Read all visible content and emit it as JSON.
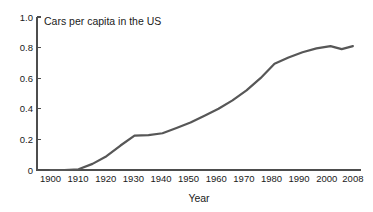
{
  "chart_data": {
    "type": "line",
    "title": "Cars per capita in the US",
    "xlabel": "Year",
    "ylabel": "",
    "xlim": [
      1895,
      2012
    ],
    "ylim": [
      0,
      1.0
    ],
    "grid": false,
    "legend": "none",
    "x_tick_labels": [
      "1900",
      "1910",
      "1920",
      "1930",
      "1940",
      "1950",
      "1960",
      "1970",
      "1980",
      "1990",
      "2000",
      "2008"
    ],
    "x_tick_values": [
      1900,
      1910,
      1920,
      1930,
      1940,
      1950,
      1960,
      1970,
      1980,
      1990,
      2000,
      2008
    ],
    "y_tick_labels": [
      "0",
      "0.2",
      "0.4",
      "0.6",
      "0.8",
      "1.0"
    ],
    "y_tick_values": [
      0,
      0.2,
      0.4,
      0.6,
      0.8,
      1.0
    ],
    "series": [
      {
        "name": "Cars per capita in the US",
        "color": "#575757",
        "x": [
          1900,
          1905,
          1910,
          1915,
          1920,
          1925,
          1930,
          1935,
          1940,
          1945,
          1950,
          1955,
          1960,
          1965,
          1970,
          1975,
          1980,
          1985,
          1990,
          1995,
          2000,
          2004,
          2008
        ],
        "values": [
          0.0,
          0.0,
          0.005,
          0.04,
          0.09,
          0.16,
          0.225,
          0.228,
          0.24,
          0.275,
          0.31,
          0.355,
          0.4,
          0.455,
          0.52,
          0.6,
          0.695,
          0.735,
          0.77,
          0.795,
          0.81,
          0.79,
          0.81
        ]
      }
    ]
  },
  "figure": {
    "title_text": "Cars per capita in the US",
    "xaxis_title": "Year",
    "background_color": "#ffffff",
    "line_color": "#575757",
    "axis_color": "#4d4d4d"
  }
}
